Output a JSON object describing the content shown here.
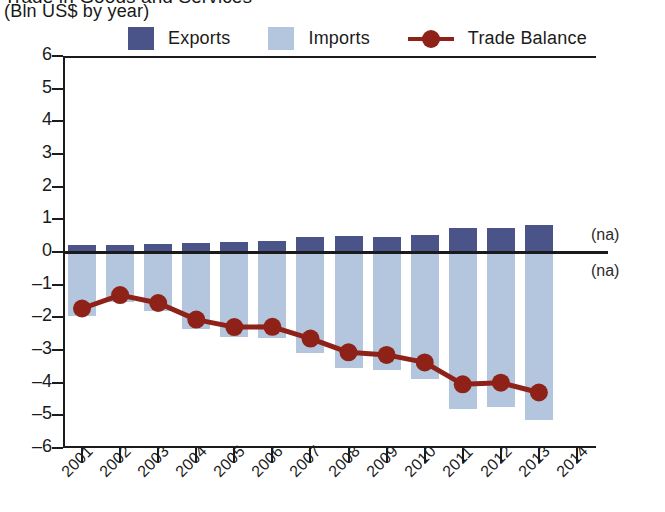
{
  "header": {
    "title_clipped": "Trade in Goods and Services",
    "subtitle": "(Bln US$ by year)"
  },
  "legend": {
    "items": [
      {
        "label": "Exports",
        "type": "swatch",
        "color": "#4a5489"
      },
      {
        "label": "Imports",
        "type": "swatch",
        "color": "#b4c6dd"
      },
      {
        "label": "Trade Balance",
        "type": "line-marker",
        "color": "#8e2118"
      }
    ]
  },
  "annotations": {
    "na_above": "(na)",
    "na_below": "(na)"
  },
  "chart_data": {
    "type": "bar",
    "title": "Trade in Goods and Services",
    "subtitle": "(Bln US$ by year)",
    "xlabel": "",
    "ylabel": "(Bln US$ by year)",
    "ylim": [
      -6,
      6
    ],
    "ytick_labels": [
      "6",
      "5",
      "4",
      "3",
      "2",
      "1",
      "0",
      "–1",
      "–2",
      "–3",
      "–4",
      "–5",
      "–6"
    ],
    "yticks": [
      6,
      5,
      4,
      3,
      2,
      1,
      0,
      -1,
      -2,
      -3,
      -4,
      -5,
      -6
    ],
    "grid": false,
    "legend_position": "top",
    "categories": [
      "2001",
      "2002",
      "2003",
      "2004",
      "2005",
      "2006",
      "2007",
      "2008",
      "2009",
      "2010",
      "2011",
      "2012",
      "2013",
      "2014"
    ],
    "series": [
      {
        "name": "Exports",
        "type": "bar",
        "color": "#4a5489",
        "values": [
          0.22,
          0.2,
          0.24,
          0.28,
          0.3,
          0.33,
          0.45,
          0.48,
          0.47,
          0.52,
          0.72,
          0.74,
          0.82,
          null
        ]
      },
      {
        "name": "Imports",
        "type": "bar",
        "color": "#b4c6dd",
        "values": [
          -1.95,
          -1.52,
          -1.8,
          -2.35,
          -2.6,
          -2.62,
          -3.1,
          -3.55,
          -3.62,
          -3.9,
          -4.8,
          -4.75,
          -5.15,
          null
        ]
      },
      {
        "name": "Trade Balance",
        "type": "line",
        "color": "#8e2118",
        "values": [
          -1.73,
          -1.32,
          -1.56,
          -2.07,
          -2.3,
          -2.29,
          -2.65,
          -3.07,
          -3.15,
          -3.38,
          -4.05,
          -4.0,
          -4.3,
          null
        ]
      }
    ],
    "missing_value_label": "(na)",
    "missing_categories": [
      "2014"
    ]
  }
}
